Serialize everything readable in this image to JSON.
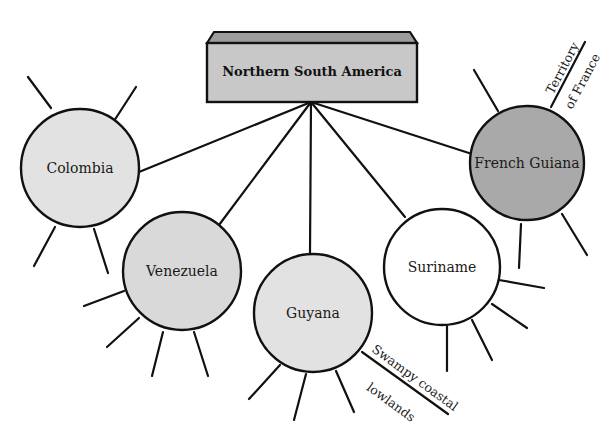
{
  "diagram": {
    "type": "spider-map",
    "title": "Northern South America",
    "colors": {
      "light_gray": "#e2e2e2",
      "medium_gray": "#d2d2d2",
      "dark_gray": "#a9a9a9",
      "white": "#ffffff",
      "title_box": "#c8c8c8",
      "title_box_top": "#9d9d9d",
      "stroke": "#111111"
    },
    "nodes": [
      {
        "id": "colombia",
        "label": "Colombia"
      },
      {
        "id": "venezuela",
        "label": "Venezuela"
      },
      {
        "id": "guyana",
        "label": "Guyana",
        "note": [
          "Swampy coastal",
          "lowlands"
        ]
      },
      {
        "id": "suriname",
        "label": "Suriname"
      },
      {
        "id": "french-guiana",
        "label": "French Guiana",
        "note": [
          "Territory",
          "of France"
        ]
      }
    ]
  }
}
